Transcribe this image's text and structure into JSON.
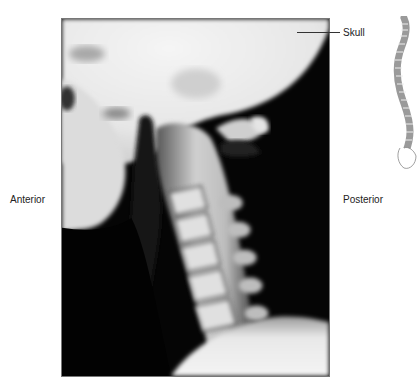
{
  "figure": {
    "image_description": "Lateral radiograph of the cervical spine",
    "labels": {
      "anterior": "Anterior",
      "posterior": "Posterior",
      "skull": "Skull"
    },
    "orientation_diagram": "spine-lateral-diagram"
  },
  "colors": {
    "background": "#ffffff",
    "frame_border": "#777777",
    "label_text": "#222222",
    "bone_light": "#f2f2f2",
    "soft_tissue_dark": "#000000",
    "spine_diagram_fill": "#9a9a9a"
  }
}
